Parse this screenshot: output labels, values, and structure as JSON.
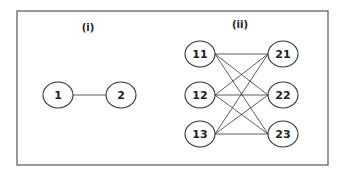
{
  "frame": {
    "x": 17,
    "y": 11,
    "width": 311,
    "height": 154,
    "stroke": "#555555"
  },
  "panels": [
    {
      "label": "(i)",
      "label_pos": [
        88,
        31
      ],
      "nodes": [
        {
          "id": "1",
          "label": "1",
          "cx": 58,
          "cy": 95
        },
        {
          "id": "2",
          "label": "2",
          "cx": 121,
          "cy": 95
        }
      ],
      "edges": [
        [
          "1",
          "2"
        ]
      ]
    },
    {
      "label": "(ii)",
      "label_pos": [
        240,
        28
      ],
      "nodes": [
        {
          "id": "11",
          "label": "11",
          "cx": 200,
          "cy": 54
        },
        {
          "id": "12",
          "label": "12",
          "cx": 200,
          "cy": 95
        },
        {
          "id": "13",
          "label": "13",
          "cx": 200,
          "cy": 134
        },
        {
          "id": "21",
          "label": "21",
          "cx": 283,
          "cy": 54
        },
        {
          "id": "22",
          "label": "22",
          "cx": 283,
          "cy": 95
        },
        {
          "id": "23",
          "label": "23",
          "cx": 283,
          "cy": 134
        }
      ],
      "edges": [
        [
          "11",
          "21"
        ],
        [
          "11",
          "22"
        ],
        [
          "11",
          "23"
        ],
        [
          "12",
          "21"
        ],
        [
          "12",
          "22"
        ],
        [
          "12",
          "23"
        ],
        [
          "13",
          "21"
        ],
        [
          "13",
          "22"
        ],
        [
          "13",
          "23"
        ]
      ]
    }
  ],
  "node_style": {
    "rx": 15,
    "ry": 13,
    "stroke": "#333333",
    "fill": "#ffffff"
  }
}
